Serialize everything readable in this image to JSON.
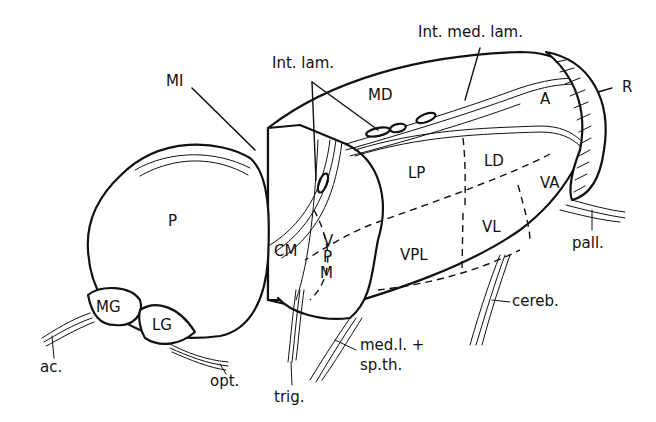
{
  "figure": {
    "labels": {
      "MI": "MI",
      "int_lam": "Int. lam.",
      "int_med_lam": "Int. med. lam.",
      "MD": "MD",
      "A": "A",
      "R": "R",
      "LP": "LP",
      "LD": "LD",
      "VA": "VA",
      "VL": "VL",
      "VPL": "VPL",
      "CM": "CM",
      "VPM_V": "V",
      "VPM_P": "P",
      "VPM_M": "M",
      "P": "P",
      "MG": "MG",
      "LG": "LG",
      "pall": "pall.",
      "cereb": "cereb.",
      "medl_1": "med.l. +",
      "medl_2": "sp.th.",
      "trig": "trig.",
      "opt": "opt.",
      "ac": "ac."
    }
  }
}
